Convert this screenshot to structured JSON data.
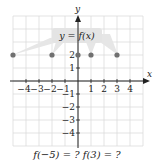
{
  "chart_data": {
    "type": "scatter",
    "title": "",
    "function_label": "y = f(x)",
    "xlabel": "x",
    "ylabel": "y",
    "xlim": [
      -5,
      5
    ],
    "ylim": [
      -5,
      5
    ],
    "grid": true,
    "x_ticks": [
      -4,
      -3,
      -2,
      -1,
      1,
      2,
      3,
      4
    ],
    "y_ticks": [
      2,
      1,
      -1,
      -2,
      -3,
      -4
    ],
    "x_tick_labels": [
      "−4",
      "−3",
      "−2",
      "−1",
      "1",
      "2",
      "3",
      "4"
    ],
    "y_tick_labels": [
      "2",
      "1",
      "−1",
      "−2",
      "−3",
      "−4"
    ],
    "points": [
      {
        "x": -5,
        "y": 2
      },
      {
        "x": -2,
        "y": 2
      },
      {
        "x": 0,
        "y": 2
      },
      {
        "x": 1,
        "y": 2
      },
      {
        "x": 3,
        "y": 2
      }
    ]
  },
  "labels": {
    "x_axis": "x",
    "y_axis": "y",
    "function": "y = f(x)",
    "question": "f(−5) = ?  f(3) = ?"
  },
  "colors": {
    "grid": "#d9d9d9",
    "axis": "#222222",
    "point": "#707070",
    "label_band": "#e4e4e4"
  }
}
